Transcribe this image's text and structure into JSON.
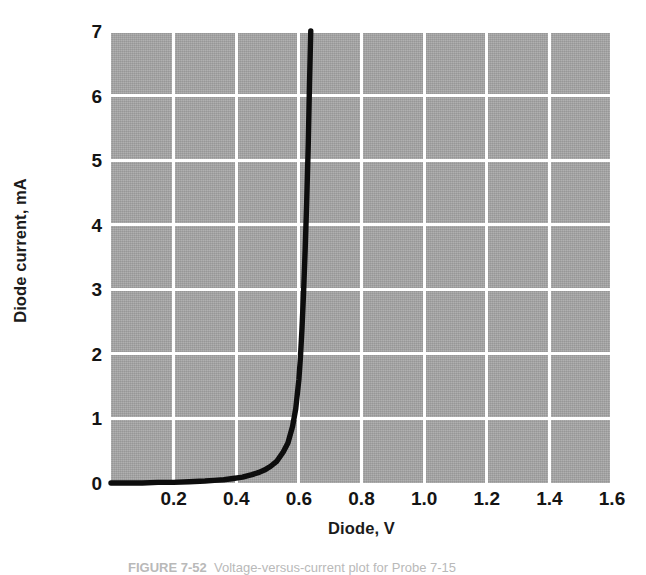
{
  "chart_data": {
    "type": "line",
    "title": "",
    "xlabel": "Diode, V",
    "ylabel": "Diode current, mA",
    "xlim": [
      0,
      1.6
    ],
    "ylim": [
      0,
      7
    ],
    "grid": true,
    "grid_color": "#ffffff",
    "plot_background": "#a6a6a6",
    "series_color": "#0d0d0d",
    "legend": null,
    "xticks": [
      0.2,
      0.4,
      0.6,
      0.8,
      1.0,
      1.2,
      1.4,
      1.6
    ],
    "xtick_labels": [
      "0.2",
      "0.4",
      "0.6",
      "0.8",
      "1.0",
      "1.2",
      "1.4",
      "1.6"
    ],
    "yticks": [
      0,
      1,
      2,
      3,
      4,
      5,
      6,
      7
    ],
    "ytick_labels": [
      "0",
      "1",
      "2",
      "3",
      "4",
      "5",
      "6",
      "7"
    ],
    "series": [
      {
        "name": "Diode I-V characteristic",
        "x": [
          0.0,
          0.05,
          0.1,
          0.15,
          0.2,
          0.25,
          0.3,
          0.33,
          0.36,
          0.39,
          0.42,
          0.45,
          0.47,
          0.49,
          0.51,
          0.53,
          0.55,
          0.565,
          0.58,
          0.59,
          0.6,
          0.605,
          0.61,
          0.615,
          0.62,
          0.625,
          0.63,
          0.634,
          0.638
        ],
        "y": [
          0.0,
          0.0,
          0.0,
          0.01,
          0.01,
          0.02,
          0.03,
          0.04,
          0.05,
          0.07,
          0.09,
          0.13,
          0.16,
          0.2,
          0.26,
          0.34,
          0.48,
          0.62,
          0.88,
          1.15,
          1.6,
          1.95,
          2.4,
          2.95,
          3.6,
          4.35,
          5.25,
          6.2,
          7.0
        ]
      }
    ]
  },
  "axis": {
    "y_title": "Diode current, mA",
    "x_title": "Diode, V"
  },
  "caption": {
    "label": "FIGURE 7-52",
    "text": "Voltage-versus-current plot for Probe 7-15"
  }
}
